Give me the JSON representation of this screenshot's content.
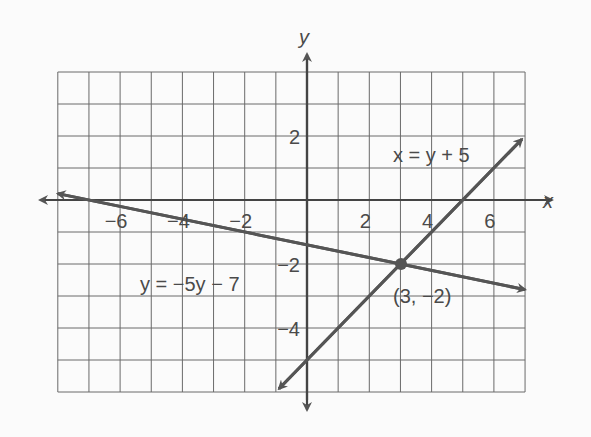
{
  "chart_data": {
    "type": "line",
    "title": "",
    "xlabel": "x",
    "ylabel": "y",
    "xlim": [
      -8,
      7
    ],
    "ylim": [
      -6,
      4
    ],
    "grid": true,
    "x_ticks": [
      -6,
      -4,
      -2,
      2,
      4,
      6
    ],
    "x_tick_labels": [
      "−6",
      "−4",
      "−2",
      "2",
      "4",
      "6"
    ],
    "y_ticks": [
      2,
      -2,
      -4
    ],
    "y_tick_labels": [
      "2",
      "−2",
      "−4"
    ],
    "series": [
      {
        "name": "x = y + 5",
        "equation": "y = x - 5",
        "x": [
          -0.9,
          6.9
        ],
        "y": [
          -5.9,
          1.9
        ]
      },
      {
        "name": "y = −5y − 7",
        "equation": "y = -x/5 - 7/5",
        "x": [
          -8,
          7
        ],
        "y": [
          0.2,
          -2.8
        ]
      }
    ],
    "annotations": [
      {
        "text": "x = y + 5",
        "x": 4.5,
        "y": 1.4
      },
      {
        "text": "y = −5y − 7",
        "x": -3.5,
        "y": -2.7
      },
      {
        "text": "(3, −2)",
        "x": 3.8,
        "y": -3.0
      }
    ],
    "points": [
      {
        "x": 3,
        "y": -2,
        "label": "(3, −2)"
      }
    ]
  },
  "labels": {
    "x_axis": "x",
    "y_axis": "y",
    "line1": "x = y + 5",
    "line2": "y = −5y − 7",
    "point": "(3, −2)"
  },
  "colors": {
    "grid": "#555555",
    "axis": "#444444",
    "line": "#555555"
  }
}
